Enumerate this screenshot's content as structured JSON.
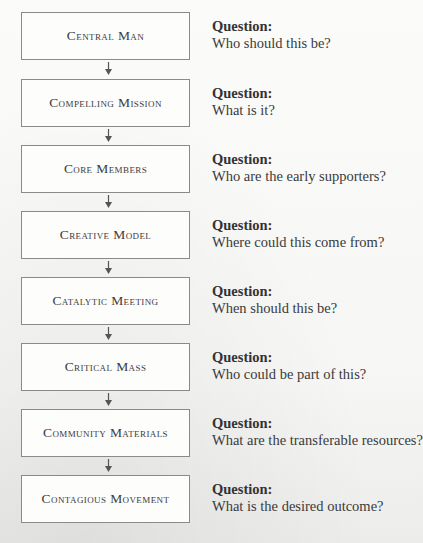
{
  "diagram": {
    "steps": [
      {
        "label": "Central Man",
        "question_heading": "Question:",
        "question": "Who should this be?"
      },
      {
        "label": "Compelling Mission",
        "question_heading": "Question:",
        "question": "What is it?"
      },
      {
        "label": "Core Members",
        "question_heading": "Question:",
        "question": "Who are the early supporters?"
      },
      {
        "label": "Creative Model",
        "question_heading": "Question:",
        "question": "Where could this come from?"
      },
      {
        "label": "Catalytic Meeting",
        "question_heading": "Question:",
        "question": "When should this be?"
      },
      {
        "label": "Critical Mass",
        "question_heading": "Question:",
        "question": "Who could be part of this?"
      },
      {
        "label": "Community Materials",
        "question_heading": "Question:",
        "question": "What are the transferable resources?"
      },
      {
        "label": "Contagious Movement",
        "question_heading": "Question:",
        "question": "What is the desired outcome?"
      }
    ],
    "connector_icon": "down-arrow-icon",
    "colors": {
      "box_border": "#8a8a8a",
      "text": "#3a3a3a",
      "arrow": "#555555"
    }
  }
}
